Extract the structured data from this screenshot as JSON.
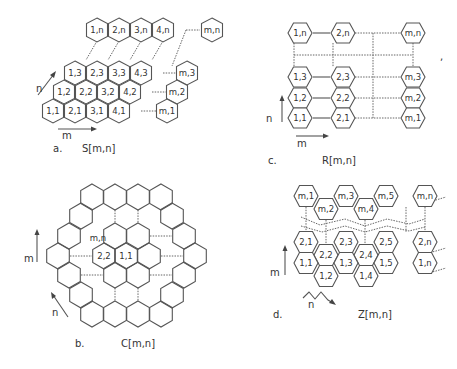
{
  "panels": {
    "a": {
      "letter": "a.",
      "caption": "S[m,n]",
      "axis_m": "m",
      "axis_n": "n",
      "cells": {
        "r1": [
          "1,1",
          "2,1",
          "3,1",
          "4,1"
        ],
        "r2": [
          "1,2",
          "2,2",
          "3,2",
          "4,2"
        ],
        "r3": [
          "1,3",
          "2,3",
          "3,3",
          "4,3"
        ],
        "rn": [
          "1,n",
          "2,n",
          "3,n",
          "4,n"
        ],
        "m1": "m,1",
        "m2": "m,2",
        "m3": "m,3",
        "mn": "m,n"
      }
    },
    "b": {
      "letter": "b.",
      "caption": "C[m,n]",
      "axis_m": "m",
      "axis_n": "n",
      "cells": {
        "c11": "1,1",
        "c22": "2,2",
        "cmn": "m,n"
      }
    },
    "c": {
      "letter": "c.",
      "caption": "R[m,n]",
      "axis_m": "m",
      "axis_n": "n",
      "cells": {
        "c11": "1,1",
        "c12": "1,2",
        "c13": "1,3",
        "c1n": "1,n",
        "c21": "2,1",
        "c22": "2,2",
        "c23": "2,3",
        "c2n": "2,n",
        "cm1": "m,1",
        "cm2": "m,2",
        "cm3": "m,3",
        "cmn": "m,n"
      }
    },
    "d": {
      "letter": "d.",
      "caption": "Z[m,n]",
      "axis_m": "m",
      "axis_n": "n",
      "cells": {
        "top": [
          "m,1",
          "m,2",
          "m,3",
          "m,4",
          "m,5",
          "m,n"
        ],
        "row2": [
          "2,1",
          "2,2",
          "2,3",
          "2,4",
          "2,5",
          "2,n"
        ],
        "row1": [
          "1,1",
          "1,2",
          "1,3",
          "1,4",
          "1,5",
          "1,n"
        ]
      }
    }
  }
}
